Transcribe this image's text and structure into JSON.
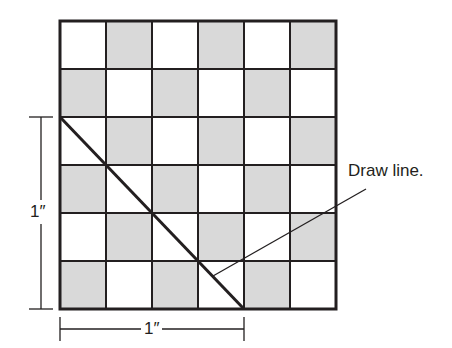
{
  "diagram": {
    "grid": {
      "rows": 6,
      "cols": 6,
      "origin": [
        60,
        21
      ],
      "cell_width": 46,
      "cell_height": 48,
      "colors": {
        "light": "#ffffff",
        "dark": "#d9d9d9",
        "line": "#231f20"
      },
      "pattern": [
        [
          "white",
          "gray",
          "white",
          "gray",
          "white",
          "gray"
        ],
        [
          "gray",
          "white",
          "gray",
          "white",
          "gray",
          "white"
        ],
        [
          "white",
          "gray",
          "white",
          "gray",
          "white",
          "gray"
        ],
        [
          "gray",
          "white",
          "gray",
          "white",
          "gray",
          "white"
        ],
        [
          "white",
          "gray",
          "white",
          "gray",
          "white",
          "gray"
        ],
        [
          "gray",
          "white",
          "gray",
          "white",
          "gray",
          "white"
        ]
      ]
    },
    "diagonal_line": {
      "from": [
        60,
        117
      ],
      "to": [
        244,
        309
      ]
    },
    "callout": {
      "text": "Draw line.",
      "line_from": [
        213,
        276
      ],
      "line_to": [
        366,
        189
      ]
    },
    "vertical_dimension": {
      "label": "1″",
      "x": 41,
      "y_from": 117,
      "y_to": 309
    },
    "horizontal_dimension": {
      "label": "1″",
      "y": 329,
      "x_from": 60,
      "x_to": 244
    }
  }
}
